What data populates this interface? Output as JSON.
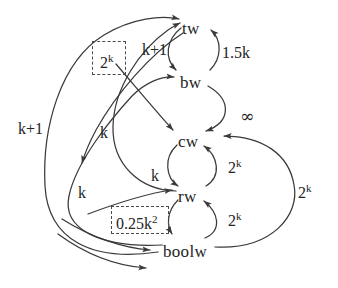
{
  "figure": {
    "type": "directed-graph",
    "background_color": "#ffffff",
    "stroke_color": "#3a3a3a",
    "text_color": "#242424"
  },
  "nodes": [
    {
      "id": "tw",
      "label": "tw",
      "x": 182,
      "y": 20
    },
    {
      "id": "bw",
      "label": "bw",
      "x": 180,
      "y": 74
    },
    {
      "id": "cw",
      "label": "cw",
      "x": 178,
      "y": 133
    },
    {
      "id": "rw",
      "label": "rw",
      "x": 178,
      "y": 188
    },
    {
      "id": "boolw",
      "label": "boolw",
      "x": 163,
      "y": 243
    }
  ],
  "edge_labels": [
    {
      "id": "tw-bw",
      "text": "k+1",
      "sup": "",
      "x": 142,
      "y": 42
    },
    {
      "id": "bw-tw",
      "text": "1.5k",
      "sup": "",
      "x": 222,
      "y": 45
    },
    {
      "id": "bw-cw-inf",
      "text": "∞",
      "sup": "",
      "x": 240,
      "y": 108
    },
    {
      "id": "boolw-tw",
      "text": "k+1",
      "sup": "",
      "x": 18,
      "y": 121
    },
    {
      "id": "rw-tw",
      "text": "k",
      "sup": "",
      "x": 100,
      "y": 125
    },
    {
      "id": "cw-rw",
      "text": "k",
      "sup": "",
      "x": 151,
      "y": 168
    },
    {
      "id": "boolw-bw",
      "text": "k",
      "sup": "",
      "x": 78,
      "y": 185
    },
    {
      "id": "rw-cw",
      "text": "2",
      "sup": "k",
      "x": 228,
      "y": 160
    },
    {
      "id": "boolw-rw",
      "text": "2",
      "sup": "k",
      "x": 228,
      "y": 213
    },
    {
      "id": "boolw-cw-out",
      "text": "2",
      "sup": "k",
      "x": 298,
      "y": 185
    }
  ],
  "boxed_labels": [
    {
      "id": "box-2k",
      "text": "2",
      "sup": "k",
      "box_x": 92,
      "box_y": 41,
      "box_w": 34,
      "box_h": 34,
      "text_x": 100,
      "text_y": 55
    },
    {
      "id": "box-025k2",
      "text": "0.25k",
      "sup": "2",
      "box_x": 111,
      "box_y": 206,
      "box_w": 58,
      "box_h": 28,
      "text_x": 116,
      "text_y": 216
    }
  ],
  "edges": [
    {
      "from": "tw",
      "to": "bw",
      "cost": "k+1"
    },
    {
      "from": "bw",
      "to": "tw",
      "cost": "1.5k"
    },
    {
      "from": "bw",
      "to": "cw",
      "cost": "∞"
    },
    {
      "from": "cw",
      "to": "rw",
      "cost": "k"
    },
    {
      "from": "rw",
      "to": "cw",
      "cost": "2^k"
    },
    {
      "from": "rw",
      "to": "boolw",
      "cost": "0.25k^2"
    },
    {
      "from": "boolw",
      "to": "rw",
      "cost": "2^k"
    },
    {
      "from": "boolw",
      "to": "cw",
      "cost": "2^k"
    },
    {
      "from": "boolw",
      "to": "bw",
      "cost": "k"
    },
    {
      "from": "boolw",
      "to": "tw",
      "cost": "k+1"
    },
    {
      "from": "rw",
      "to": "tw",
      "cost": "k"
    },
    {
      "from": "tw",
      "to": "cw",
      "cost": "2^k"
    }
  ]
}
